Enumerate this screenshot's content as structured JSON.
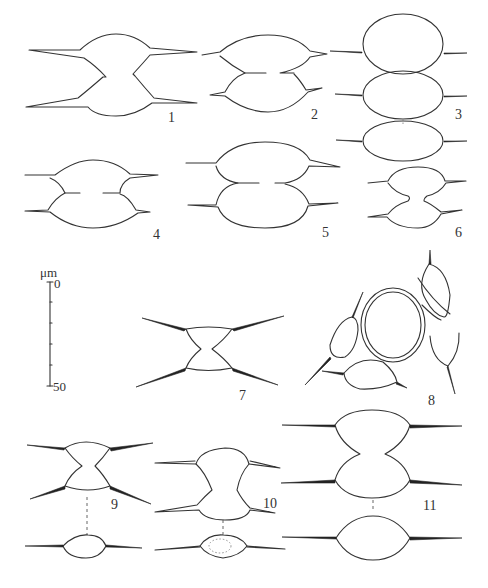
{
  "figure": {
    "type": "scientific illustration plate",
    "panels": [
      {
        "id": "fig-1",
        "label": "1",
        "view": "front"
      },
      {
        "id": "fig-2",
        "label": "2",
        "view": "front"
      },
      {
        "id": "fig-3",
        "label": "3",
        "view": "front + apical"
      },
      {
        "id": "fig-4",
        "label": "4",
        "view": "front"
      },
      {
        "id": "fig-5",
        "label": "5",
        "view": "front"
      },
      {
        "id": "fig-6",
        "label": "6",
        "view": "front"
      },
      {
        "id": "fig-7",
        "label": "7",
        "view": "front"
      },
      {
        "id": "fig-8",
        "label": "8",
        "view": "cells around a circular object"
      },
      {
        "id": "fig-9",
        "label": "9",
        "view": "front + apical"
      },
      {
        "id": "fig-10",
        "label": "10",
        "view": "front + apical"
      },
      {
        "id": "fig-11",
        "label": "11",
        "view": "front + apical"
      }
    ],
    "scale_bar": {
      "unit": "μm",
      "start": "0",
      "end": "50",
      "minor_ticks": 4
    }
  }
}
